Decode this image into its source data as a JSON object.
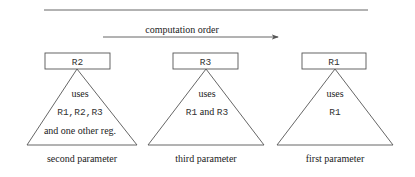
{
  "header": {
    "arrow_label": "computation order"
  },
  "nodes": [
    {
      "register": "R2",
      "lines": [
        {
          "text": "uses",
          "style": "serif"
        },
        {
          "text": "R1,R2,R3",
          "style": "mono"
        },
        {
          "text": "and one other reg.",
          "style": "serif"
        }
      ],
      "caption": "second parameter"
    },
    {
      "register": "R3",
      "lines": [
        {
          "text": "uses",
          "style": "serif"
        },
        {
          "text": "R1 and R3",
          "style": "mixed"
        }
      ],
      "caption": "third parameter"
    },
    {
      "register": "R1",
      "lines": [
        {
          "text": "uses",
          "style": "serif"
        },
        {
          "text": "R1",
          "style": "mono"
        }
      ],
      "caption": "first parameter"
    }
  ],
  "colors": {
    "stroke": "#555555",
    "text": "#222222",
    "background": "#ffffff"
  }
}
